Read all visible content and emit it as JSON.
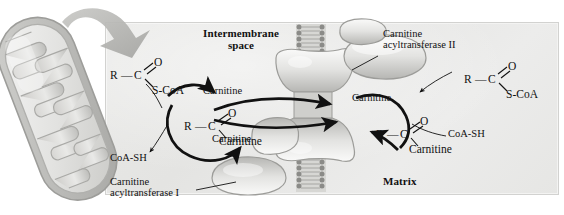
{
  "figure": {
    "title_regions": {
      "intermembrane_line1": "Intermembrane",
      "intermembrane_line2": "space",
      "matrix": "Matrix"
    },
    "enzymes": [
      {
        "id": "cat1",
        "line1": "Carnitine",
        "line2": "acyltransferase I"
      },
      {
        "id": "cat2",
        "line1": "Carnitine",
        "line2": "acyltransferase II"
      }
    ],
    "molecules": {
      "acyl_coa_left": {
        "r": "R",
        "bond": "—",
        "c": "C",
        "o": "O",
        "tail": "S-CoA"
      },
      "acyl_carnitine_left": {
        "r": "R",
        "bond": "—",
        "c": "C",
        "o": "O",
        "tail": "Carnitine"
      },
      "acyl_carnitine_right": {
        "r": "R",
        "bond": "—",
        "c": "C",
        "o": "O",
        "tail": "Carnitine"
      },
      "acyl_coa_right": {
        "r": "R",
        "bond": "—",
        "c": "C",
        "o": "O",
        "tail": "S-CoA"
      }
    },
    "free_labels": {
      "carnitine_left_top": "Carnitine",
      "carnitine_left_bottom": "Carnitine",
      "carnitine_right": "Carnitine",
      "coash_left": "CoA-SH",
      "coash_right": "CoA-SH"
    },
    "colors": {
      "panel_bg": "#e8e8e6",
      "ink": "#111111",
      "protein_fill": "#dcdcda",
      "protein_shade": "#b4b4b1",
      "membrane_head": "#8f8f8c",
      "mito_fill": "#d9d9d7",
      "mito_outline": "#a9a9a6",
      "big_arrow": "#b6b6b3"
    },
    "icon_names": [
      "mitochondrion-illustration",
      "zoom-callout-arrow",
      "lipid-bilayer-upper",
      "lipid-bilayer-lower",
      "acylcarnitine-carnitine-transporter",
      "carnitine-acyltransferase-I-protein",
      "carnitine-acyltransferase-II-protein",
      "reaction-arrow-left-cycle",
      "reaction-arrow-right-cycle",
      "transport-arrow-inward",
      "transport-arrow-outward"
    ]
  }
}
